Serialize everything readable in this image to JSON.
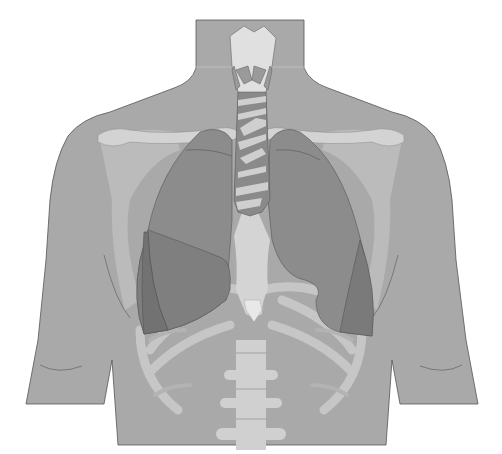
{
  "figure": {
    "colors": {
      "background": "#ffffff",
      "body": "#a9a9a9",
      "body_outline": "#555555",
      "bone": "#c9c9c9",
      "bone_light": "#dedede",
      "lung_upper": "#8c8c8c",
      "lung_lower": "#7d7d7d",
      "lung_outline": "#555555",
      "trachea_ring": "#cfcfcf",
      "trachea_gap": "#8a8a8a",
      "larynx": "#e0e0e0"
    }
  }
}
